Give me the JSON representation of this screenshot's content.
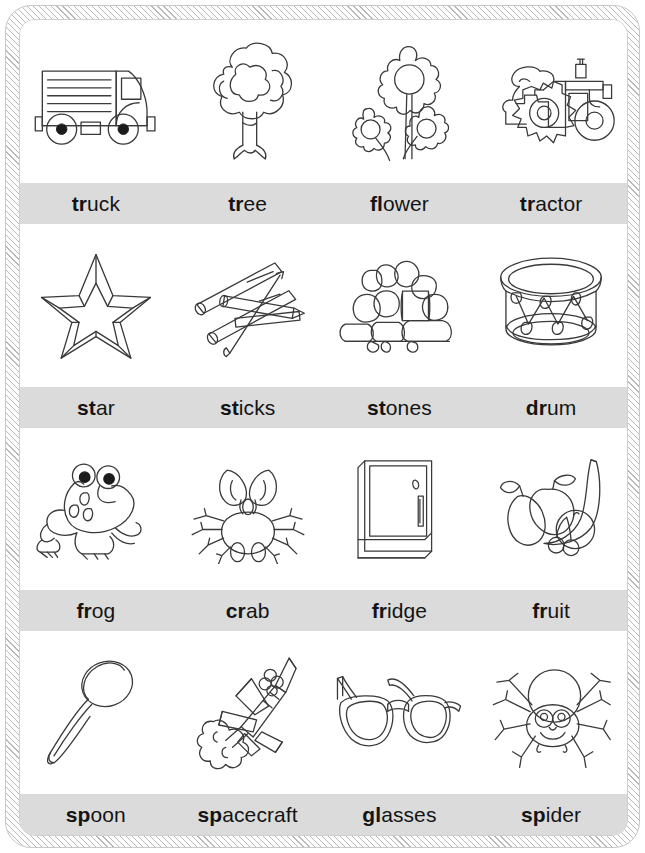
{
  "worksheet": {
    "title": "Consonant blends picture and word chart",
    "band_color": "#dbdbdb",
    "border_color": "#b9b9b9",
    "ink_color": "#3a3a3a",
    "columns": 4,
    "rows": [
      {
        "row_index": 1,
        "cells": [
          {
            "word": "truck",
            "blend": "tr",
            "rest": "uck",
            "icon": "truck-icon"
          },
          {
            "word": "tree",
            "blend": "tr",
            "rest": "ee",
            "icon": "tree-icon"
          },
          {
            "word": "flower",
            "blend": "fl",
            "rest": "ower",
            "icon": "flower-icon"
          },
          {
            "word": "tractor",
            "blend": "tr",
            "rest": "actor",
            "icon": "tractor-icon"
          }
        ]
      },
      {
        "row_index": 2,
        "cells": [
          {
            "word": "star",
            "blend": "st",
            "rest": "ar",
            "icon": "star-icon"
          },
          {
            "word": "sticks",
            "blend": "st",
            "rest": "icks",
            "icon": "sticks-icon"
          },
          {
            "word": "stones",
            "blend": "st",
            "rest": "ones",
            "icon": "stones-icon"
          },
          {
            "word": "drum",
            "blend": "dr",
            "rest": "um",
            "icon": "drum-icon"
          }
        ]
      },
      {
        "row_index": 3,
        "cells": [
          {
            "word": "frog",
            "blend": "fr",
            "rest": "og",
            "icon": "frog-icon"
          },
          {
            "word": "crab",
            "blend": "cr",
            "rest": "ab",
            "icon": "crab-icon"
          },
          {
            "word": "fridge",
            "blend": "fr",
            "rest": "idge",
            "icon": "fridge-icon"
          },
          {
            "word": "fruit",
            "blend": "fr",
            "rest": "uit",
            "icon": "fruit-icon"
          }
        ]
      },
      {
        "row_index": 4,
        "cells": [
          {
            "word": "spoon",
            "blend": "sp",
            "rest": "oon",
            "icon": "spoon-icon"
          },
          {
            "word": "spacecraft",
            "blend": "sp",
            "rest": "acecraft",
            "icon": "spacecraft-icon"
          },
          {
            "word": "glasses",
            "blend": "gl",
            "rest": "asses",
            "icon": "glasses-icon"
          },
          {
            "word": "spider",
            "blend": "sp",
            "rest": "ider",
            "icon": "spider-icon"
          }
        ]
      }
    ]
  }
}
